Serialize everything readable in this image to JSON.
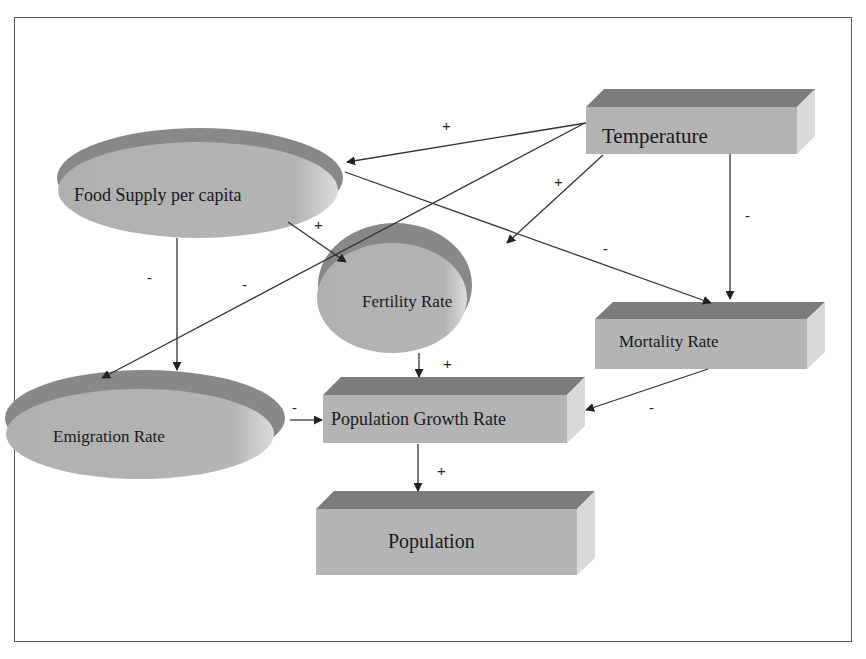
{
  "diagram": {
    "type": "causal-loop",
    "colors": {
      "box_front": "#b4b4b4",
      "box_top": "#7c7c7c",
      "box_side": "#d9d9d9",
      "ellipse_body": "#b2b2b2",
      "ellipse_rim": "#888888",
      "arrow": "#333333",
      "frame": "#5a5a5a"
    },
    "nodes": {
      "temperature": {
        "label": "Temperature",
        "shape": "box"
      },
      "food_supply": {
        "label": "Food Supply per capita",
        "shape": "ellipse"
      },
      "fertility": {
        "label": "Fertility Rate",
        "shape": "ellipse"
      },
      "mortality": {
        "label": "Mortality Rate",
        "shape": "box"
      },
      "emigration": {
        "label": "Emigration Rate",
        "shape": "ellipse"
      },
      "growth": {
        "label": "Population Growth Rate",
        "shape": "box"
      },
      "population": {
        "label": "Population",
        "shape": "box"
      }
    },
    "edges": [
      {
        "from": "Temperature",
        "to": "Food Supply per capita",
        "sign": "+"
      },
      {
        "from": "Temperature",
        "to": "Fertility Rate",
        "sign": "+"
      },
      {
        "from": "Temperature",
        "to": "Mortality Rate",
        "sign": "-"
      },
      {
        "from": "Temperature",
        "to": "Emigration Rate",
        "sign": "-"
      },
      {
        "from": "Food Supply per capita",
        "to": "Fertility Rate",
        "sign": "+"
      },
      {
        "from": "Food Supply per capita",
        "to": "Mortality Rate",
        "sign": "-"
      },
      {
        "from": "Food Supply per capita",
        "to": "Emigration Rate",
        "sign": "-"
      },
      {
        "from": "Fertility Rate",
        "to": "Population Growth Rate",
        "sign": "+"
      },
      {
        "from": "Mortality Rate",
        "to": "Population Growth Rate",
        "sign": "-"
      },
      {
        "from": "Emigration Rate",
        "to": "Population Growth Rate",
        "sign": "-"
      },
      {
        "from": "Population Growth Rate",
        "to": "Population",
        "sign": "+"
      }
    ],
    "signs": {
      "temp_food": "+",
      "temp_fert": "+",
      "temp_mort": "-",
      "temp_emig": "-",
      "food_fert": "+",
      "food_mort": "-",
      "food_emig": "-",
      "fert_growth": "+",
      "mort_growth": "-",
      "emig_growth": "-",
      "growth_pop": "+"
    }
  }
}
